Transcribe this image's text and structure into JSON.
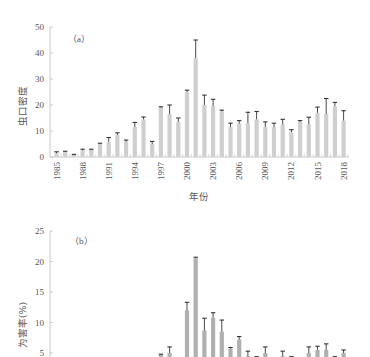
{
  "chart_data": [
    {
      "type": "bar",
      "panel_label": "（a）",
      "title": "",
      "xlabel": "年份",
      "ylabel": "虫口密度",
      "ylim": [
        0,
        50
      ],
      "yticks": [
        0,
        10,
        20,
        30,
        40,
        50
      ],
      "xtick_labels": [
        "1985",
        "1988",
        "1991",
        "1994",
        "1997",
        "2000",
        "2003",
        "2006",
        "2009",
        "2012",
        "2015",
        "2018"
      ],
      "categories": [
        1985,
        1986,
        1987,
        1988,
        1989,
        1990,
        1991,
        1992,
        1993,
        1994,
        1995,
        1996,
        1997,
        1998,
        1999,
        2000,
        2001,
        2002,
        2003,
        2004,
        2005,
        2006,
        2007,
        2008,
        2009,
        2010,
        2011,
        2012,
        2013,
        2014,
        2015,
        2016,
        2017,
        2018
      ],
      "values": [
        1.5,
        2.0,
        0.8,
        2.5,
        2.7,
        5.0,
        5.8,
        8.5,
        5.8,
        11.5,
        14.5,
        5.0,
        19.0,
        16.5,
        13.5,
        25.0,
        38.0,
        20.0,
        19.5,
        17.5,
        11.5,
        12.8,
        13.0,
        14.5,
        11.5,
        11.5,
        12.5,
        9.5,
        13.5,
        12.5,
        17.0,
        16.5,
        19.5,
        14.0
      ],
      "error_upper": [
        2.0,
        2.2,
        1.0,
        3.0,
        3.0,
        5.3,
        7.5,
        9.3,
        6.5,
        13.3,
        15.4,
        6.0,
        19.3,
        20.0,
        15.0,
        25.7,
        45.0,
        23.8,
        22.2,
        18.0,
        13.0,
        14.0,
        17.2,
        17.5,
        13.5,
        13.0,
        14.5,
        10.5,
        14.0,
        15.3,
        19.2,
        22.5,
        21.0,
        17.8
      ],
      "bar_color": "#cfcfcf",
      "error_color": "#333333",
      "grid": false
    },
    {
      "type": "bar",
      "panel_label": "（b）",
      "title": "",
      "xlabel": "",
      "ylabel": "为害率(%)",
      "ylim": [
        0,
        25
      ],
      "yticks": [
        5,
        10,
        15,
        20,
        25
      ],
      "categories": [
        1997,
        1998,
        2000,
        2001,
        2002,
        2003,
        2004,
        2005,
        2006,
        2007,
        2008,
        2009,
        2011,
        2012,
        2014,
        2015,
        2016,
        2017,
        2018
      ],
      "values": [
        4.7,
        5.0,
        12.0,
        20.5,
        8.7,
        10.8,
        8.5,
        5.7,
        7.2,
        4.5,
        4.3,
        5.0,
        4.5,
        4.3,
        5.0,
        5.5,
        5.5,
        4.3,
        5.0
      ],
      "error_upper": [
        4.8,
        6.0,
        13.3,
        20.7,
        10.7,
        11.6,
        10.4,
        5.9,
        7.7,
        5.3,
        4.4,
        6.0,
        5.3,
        4.4,
        6.0,
        6.1,
        6.5,
        4.4,
        5.5
      ],
      "bar_color": "#b0b0b0",
      "error_color": "#333333",
      "grid": false,
      "note": "panel cropped at bottom; values below ~4.3 not visible"
    }
  ]
}
